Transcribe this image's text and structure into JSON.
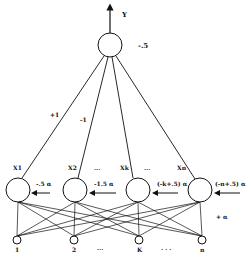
{
  "diagram": {
    "output": {
      "label": "Y",
      "bias": "-.5",
      "cx": 110,
      "cy": 45,
      "r": 12
    },
    "hidden_weight_labels": [
      "+1",
      "-1"
    ],
    "hidden": [
      {
        "label": "X1",
        "cx": 18,
        "cy": 190,
        "threshold": "-.5  α"
      },
      {
        "label": "X2",
        "cx": 75,
        "cy": 190,
        "threshold": "-1.5  α"
      },
      {
        "label": "Xk",
        "cx": 138,
        "cy": 190,
        "threshold": "(-k+.5) α"
      },
      {
        "label": "Xn",
        "cx": 200,
        "cy": 190,
        "threshold": "(-n+.5) α"
      }
    ],
    "hidden_ellipsis": [
      "...",
      "..."
    ],
    "inputs": [
      {
        "label": "1",
        "cx": 17,
        "cy": 240
      },
      {
        "label": "2",
        "cx": 74,
        "cy": 240
      },
      {
        "label": "K",
        "cx": 139,
        "cy": 240
      },
      {
        "label": "n",
        "cx": 202,
        "cy": 240
      }
    ],
    "input_ellipsis": [
      "...",
      ". . ."
    ],
    "input_weight": "+ α",
    "colors": {
      "stroke": "#111111",
      "background": "#ffffff"
    }
  }
}
